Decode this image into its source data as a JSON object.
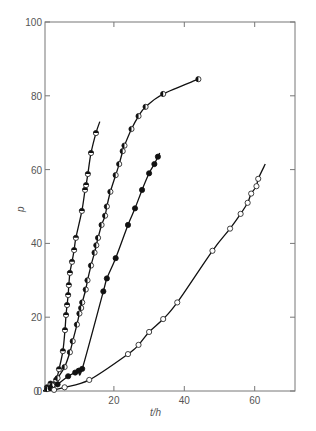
{
  "chart_data": {
    "type": "scatter",
    "title": "",
    "xlabel": "t/h",
    "ylabel": "p",
    "xlim": [
      0,
      70
    ],
    "ylim": [
      0,
      100
    ],
    "x_ticks": [
      0,
      20,
      40,
      60
    ],
    "y_ticks": [
      0,
      20,
      40,
      60,
      80,
      100
    ],
    "grid": false,
    "legend": null,
    "series": [
      {
        "name": "series-a-top-half-filled",
        "marker": "half-top",
        "points": [
          [
            0,
            0
          ],
          [
            1,
            1
          ],
          [
            2,
            2
          ],
          [
            3.6,
            3.0
          ],
          [
            4.4,
            5.9
          ],
          [
            5.5,
            10.8
          ],
          [
            6.1,
            16.5
          ],
          [
            6.4,
            20.6
          ],
          [
            6.7,
            23.3
          ],
          [
            7.0,
            26.0
          ],
          [
            7.2,
            28.7
          ],
          [
            7.5,
            32.0
          ],
          [
            8.1,
            35.0
          ],
          [
            8.7,
            38.2
          ],
          [
            9.2,
            41.5
          ],
          [
            10.9,
            48.8
          ],
          [
            11.8,
            54.5
          ],
          [
            12.1,
            55.8
          ],
          [
            12.6,
            58.8
          ],
          [
            13.5,
            64.5
          ],
          [
            14.9,
            69.9
          ]
        ],
        "curve_end": [
          16.0,
          73.0
        ]
      },
      {
        "name": "series-b-left-half-filled",
        "marker": "half-left",
        "points": [
          [
            0,
            0
          ],
          [
            1,
            0.5
          ],
          [
            2.5,
            1.5
          ],
          [
            4,
            3.5
          ],
          [
            6,
            6.5
          ],
          [
            7.5,
            10.5
          ],
          [
            8.3,
            13.5
          ],
          [
            9.5,
            18
          ],
          [
            10.2,
            21
          ],
          [
            10.7,
            22.5
          ],
          [
            11,
            24
          ],
          [
            12,
            27.5
          ],
          [
            12.5,
            30
          ],
          [
            13.5,
            34
          ],
          [
            14.5,
            37.5
          ],
          [
            15,
            39.5
          ],
          [
            15.5,
            41.5
          ],
          [
            16.5,
            45
          ],
          [
            17.5,
            47.5
          ],
          [
            18,
            50
          ],
          [
            19,
            54
          ],
          [
            20.5,
            58.5
          ],
          [
            21.5,
            61.5
          ],
          [
            22.5,
            65
          ],
          [
            23,
            66.5
          ],
          [
            25,
            71
          ],
          [
            27,
            74.5
          ],
          [
            29,
            77
          ],
          [
            34,
            80.5
          ],
          [
            44,
            84.5
          ]
        ]
      },
      {
        "name": "series-c-filled",
        "marker": "filled",
        "points": [
          [
            0,
            0
          ],
          [
            2,
            0.8
          ],
          [
            4,
            1.8
          ],
          [
            7,
            4
          ],
          [
            9,
            5
          ],
          [
            10,
            5.5
          ],
          [
            11,
            6
          ],
          [
            17,
            27
          ],
          [
            18,
            30.5
          ],
          [
            20.5,
            36
          ],
          [
            24,
            45
          ],
          [
            26,
            49.5
          ],
          [
            28,
            54.5
          ],
          [
            30,
            59
          ],
          [
            31.5,
            61.5
          ],
          [
            32.5,
            63.5
          ]
        ],
        "curve_end": [
          33,
          64.5
        ]
      },
      {
        "name": "series-d-open",
        "marker": "open",
        "points": [
          [
            0,
            0
          ],
          [
            3,
            0.3
          ],
          [
            6,
            1
          ],
          [
            13,
            3
          ],
          [
            24,
            10
          ],
          [
            27,
            12.5
          ],
          [
            30,
            16
          ],
          [
            34,
            19.5
          ],
          [
            38,
            24
          ],
          [
            48,
            38
          ],
          [
            53,
            44
          ],
          [
            56,
            48
          ],
          [
            58,
            51
          ],
          [
            59,
            53.5
          ],
          [
            60.5,
            55.5
          ],
          [
            61,
            57.5
          ]
        ],
        "curve_end": [
          63,
          61.5
        ]
      }
    ]
  },
  "axes": {
    "x_tick_labels": [
      "0",
      "20",
      "40",
      "60"
    ],
    "y_tick_labels": [
      "0",
      "20",
      "40",
      "60",
      "80",
      "100"
    ],
    "xlabel": "t/h",
    "ylabel": "p"
  }
}
